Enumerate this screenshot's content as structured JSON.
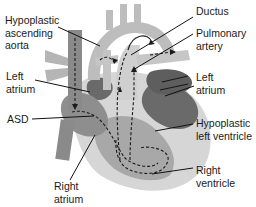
{
  "labels": {
    "hypoplastic_ascending_aorta": "Hypoplastic\nascending\naorta",
    "left_atrium_left": "Left\natrium",
    "asd": "ASD",
    "right_atrium": "Right\natrium",
    "ductus": "Ductus",
    "pulmonary_artery": "Pulmonary\nartery",
    "left_atrium_right": "Left\natrium",
    "hypoplastic_left_ventricle": "Hypoplastic\nleft ventricle",
    "right_ventricle": "Right\nventricle"
  },
  "colors": {
    "background": "#ffffff",
    "light_gray": "#c8c8c8",
    "mid_gray": "#9a9a9a",
    "dark_gray": "#6e6e6e",
    "darker_gray": "#5a5a5a",
    "pale_gray": "#d8d8d8",
    "line": "#111111"
  }
}
